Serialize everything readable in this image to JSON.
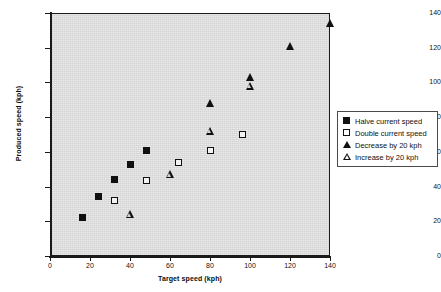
{
  "chart_data": {
    "type": "scatter",
    "title": "",
    "xlabel": "Target speed (kph)",
    "ylabel": "Produced speed (kph)",
    "xlim": [
      0,
      140
    ],
    "ylim": [
      0,
      140
    ],
    "xticks": [
      0,
      20,
      40,
      60,
      80,
      100,
      120,
      140
    ],
    "yticks": [
      0,
      20,
      40,
      60,
      80,
      100,
      120,
      140
    ],
    "grid": false,
    "legend_position": "right",
    "plot_background": "#d4d4d4",
    "marker_color": "#111111",
    "series": [
      {
        "name": "Halve current speed",
        "marker": "filled-square",
        "points": [
          {
            "x": 16,
            "y": 22
          },
          {
            "x": 24,
            "y": 34
          },
          {
            "x": 32,
            "y": 44
          },
          {
            "x": 40,
            "y": 53
          },
          {
            "x": 48,
            "y": 61
          }
        ]
      },
      {
        "name": "Double current speed",
        "marker": "open-square",
        "points": [
          {
            "x": 32,
            "y": 32
          },
          {
            "x": 48,
            "y": 43.5
          },
          {
            "x": 64,
            "y": 54
          },
          {
            "x": 80,
            "y": 61
          },
          {
            "x": 96,
            "y": 70
          }
        ]
      },
      {
        "name": "Decrease by 20 kph",
        "marker": "filled-triangle",
        "points": [
          {
            "x": 80,
            "y": 88
          },
          {
            "x": 100,
            "y": 103
          },
          {
            "x": 120,
            "y": 121
          },
          {
            "x": 140,
            "y": 134
          }
        ]
      },
      {
        "name": "Increase by 20 kph",
        "marker": "open-triangle",
        "points": [
          {
            "x": 40,
            "y": 24
          },
          {
            "x": 60,
            "y": 47
          },
          {
            "x": 80,
            "y": 72
          },
          {
            "x": 100,
            "y": 98
          }
        ]
      }
    ]
  },
  "legend": {
    "items": [
      {
        "label": "Halve current speed",
        "marker": "filled-square"
      },
      {
        "label": "Double current speed",
        "marker": "open-square"
      },
      {
        "label": "Decrease by 20 kph",
        "marker": "filled-triangle"
      },
      {
        "label": "Increase by 20 kph",
        "marker": "open-triangle"
      }
    ]
  }
}
